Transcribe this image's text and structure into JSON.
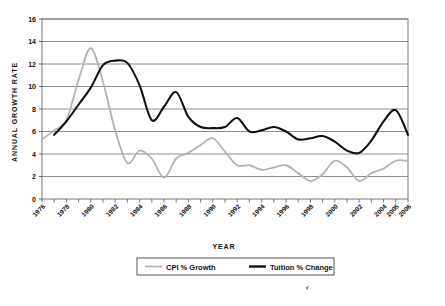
{
  "chart_data": {
    "type": "line",
    "title": "",
    "xlabel": "YEAR",
    "ylabel": "ANNUAL GROWTH RATE",
    "xlim": [
      1976,
      2006
    ],
    "ylim": [
      0,
      16
    ],
    "ytick_step": 2,
    "yticks": [
      "0",
      "2",
      "4",
      "6",
      "8",
      "10",
      "12",
      "14",
      "16"
    ],
    "xticks": [
      "1976",
      "1978",
      "1980",
      "1982",
      "1984",
      "1986",
      "1988",
      "1990",
      "1992",
      "1994",
      "1996",
      "1998",
      "2000",
      "2002",
      "2004",
      "2005",
      "2006"
    ],
    "xtick_rotation": -45,
    "grid": "horizontal",
    "legend_position": "bottom",
    "x": [
      1976,
      1977,
      1978,
      1979,
      1980,
      1981,
      1982,
      1983,
      1984,
      1985,
      1986,
      1987,
      1988,
      1989,
      1990,
      1991,
      1992,
      1993,
      1994,
      1995,
      1996,
      1997,
      1998,
      1999,
      2000,
      2001,
      2002,
      2003,
      2004,
      2005,
      2006
    ],
    "series": [
      {
        "name": "CPI % Growth",
        "color": "#b3b3b3",
        "values": [
          5.3,
          6.1,
          7.0,
          10.6,
          13.4,
          10.4,
          6.1,
          3.2,
          4.3,
          3.6,
          1.9,
          3.6,
          4.1,
          4.8,
          5.4,
          4.2,
          3.0,
          3.0,
          2.6,
          2.8,
          3.0,
          2.3,
          1.6,
          2.2,
          3.4,
          2.8,
          1.6,
          2.3,
          2.7,
          3.4,
          3.4
        ]
      },
      {
        "name": "Tuition % Change",
        "color": "#111111",
        "values": [
          null,
          5.7,
          6.9,
          8.4,
          9.9,
          11.9,
          12.3,
          12.1,
          10.1,
          7.0,
          8.2,
          9.5,
          7.3,
          6.4,
          6.3,
          6.4,
          7.2,
          6.0,
          6.1,
          6.4,
          6.0,
          5.3,
          5.4,
          5.6,
          5.1,
          4.3,
          4.1,
          5.2,
          6.9,
          7.9,
          5.7
        ]
      }
    ]
  },
  "legend": {
    "items": [
      {
        "label": "CPI % Growth",
        "color": "#b3b3b3"
      },
      {
        "label": "Tuition % Change",
        "color": "#111111"
      }
    ]
  }
}
